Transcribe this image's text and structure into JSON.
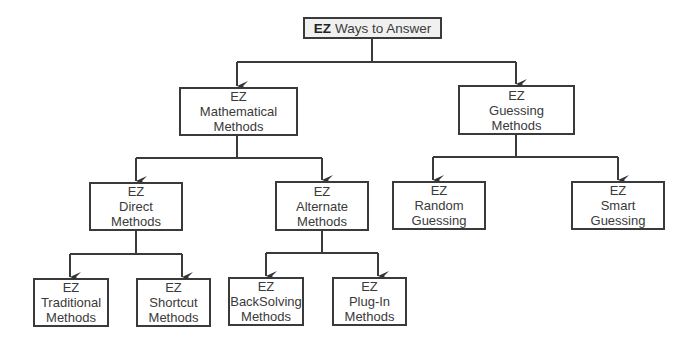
{
  "root": {
    "prefix": "EZ",
    "label": "Ways to Answer"
  },
  "nodes": {
    "math": {
      "l1": "EZ",
      "l2": "Mathematical",
      "l3": "Methods"
    },
    "guess": {
      "l1": "EZ",
      "l2": "Guessing",
      "l3": "Methods"
    },
    "direct": {
      "l1": "EZ",
      "l2": "Direct",
      "l3": "Methods"
    },
    "alternate": {
      "l1": "EZ",
      "l2": "Alternate",
      "l3": "Methods"
    },
    "random": {
      "l1": "EZ",
      "l2": "Random",
      "l3": "Guessing"
    },
    "smart": {
      "l1": "EZ",
      "l2": "Smart",
      "l3": "Guessing"
    },
    "traditional": {
      "l1": "EZ",
      "l2": "Traditional",
      "l3": "Methods"
    },
    "shortcut": {
      "l1": "EZ",
      "l2": "Shortcut",
      "l3": "Methods"
    },
    "backsolving": {
      "l1": "EZ",
      "l2": "BackSolving",
      "l3": "Methods"
    },
    "plugin": {
      "l1": "EZ",
      "l2": "Plug-In",
      "l3": "Methods"
    }
  }
}
